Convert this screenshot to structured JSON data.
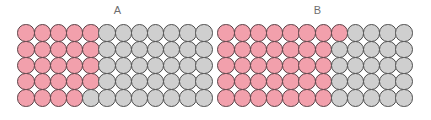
{
  "figure": {
    "background_color": "#ffffff",
    "pink_color": "#f2a0ac",
    "gray_color": "#cfcfcf",
    "outline_color": "#4d4d4d",
    "label_color": "#6e6e6e"
  },
  "panels": [
    {
      "label": "A",
      "rows": 5,
      "columns": 12,
      "total_circles": 60,
      "pink_per_row": [
        5,
        5,
        5,
        5,
        4
      ],
      "gray_per_row": [
        7,
        7,
        7,
        7,
        8
      ],
      "pink_total": 24,
      "gray_total": 36,
      "grid": [
        [
          "pink",
          "pink",
          "pink",
          "pink",
          "pink",
          "gray",
          "gray",
          "gray",
          "gray",
          "gray",
          "gray",
          "gray"
        ],
        [
          "pink",
          "pink",
          "pink",
          "pink",
          "pink",
          "gray",
          "gray",
          "gray",
          "gray",
          "gray",
          "gray",
          "gray"
        ],
        [
          "pink",
          "pink",
          "pink",
          "pink",
          "pink",
          "gray",
          "gray",
          "gray",
          "gray",
          "gray",
          "gray",
          "gray"
        ],
        [
          "pink",
          "pink",
          "pink",
          "pink",
          "pink",
          "gray",
          "gray",
          "gray",
          "gray",
          "gray",
          "gray",
          "gray"
        ],
        [
          "pink",
          "pink",
          "pink",
          "pink",
          "gray",
          "gray",
          "gray",
          "gray",
          "gray",
          "gray",
          "gray",
          "gray"
        ]
      ]
    },
    {
      "label": "B",
      "rows": 5,
      "columns": 12,
      "total_circles": 60,
      "pink_per_row": [
        8,
        7,
        7,
        7,
        7
      ],
      "gray_per_row": [
        4,
        5,
        5,
        5,
        5
      ],
      "pink_total": 36,
      "gray_total": 24,
      "grid": [
        [
          "pink",
          "pink",
          "pink",
          "pink",
          "pink",
          "pink",
          "pink",
          "pink",
          "gray",
          "gray",
          "gray",
          "gray"
        ],
        [
          "pink",
          "pink",
          "pink",
          "pink",
          "pink",
          "pink",
          "pink",
          "gray",
          "gray",
          "gray",
          "gray",
          "gray"
        ],
        [
          "pink",
          "pink",
          "pink",
          "pink",
          "pink",
          "pink",
          "pink",
          "gray",
          "gray",
          "gray",
          "gray",
          "gray"
        ],
        [
          "pink",
          "pink",
          "pink",
          "pink",
          "pink",
          "pink",
          "pink",
          "gray",
          "gray",
          "gray",
          "gray",
          "gray"
        ],
        [
          "pink",
          "pink",
          "pink",
          "pink",
          "pink",
          "pink",
          "pink",
          "gray",
          "gray",
          "gray",
          "gray",
          "gray"
        ]
      ]
    }
  ],
  "chart_data": {
    "type": "heatmap",
    "title": "",
    "xlabel": "",
    "ylabel": "",
    "grid": true,
    "legend": "none",
    "categories": [
      "A",
      "B"
    ],
    "series": [
      {
        "name": "pink",
        "values": [
          24,
          36
        ]
      },
      {
        "name": "gray",
        "values": [
          36,
          24
        ]
      }
    ],
    "proportions": [
      0.4,
      0.6
    ],
    "cells_per_panel": 60
  }
}
